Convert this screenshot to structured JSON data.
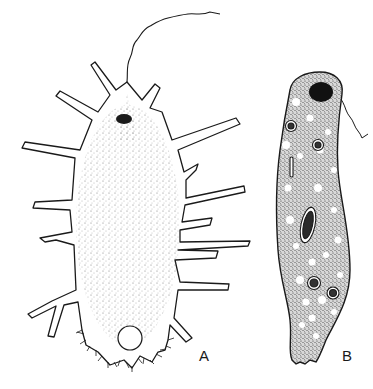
{
  "figure": {
    "panels": [
      {
        "label": "A",
        "subject": "amoeboid-flagellate-with-pseudopodia"
      },
      {
        "label": "B",
        "subject": "elongated-flagellate-with-vacuoles"
      }
    ],
    "colors": {
      "ink": "#1a1a1a",
      "paper": "#ffffff",
      "stipple": "#555555"
    }
  }
}
